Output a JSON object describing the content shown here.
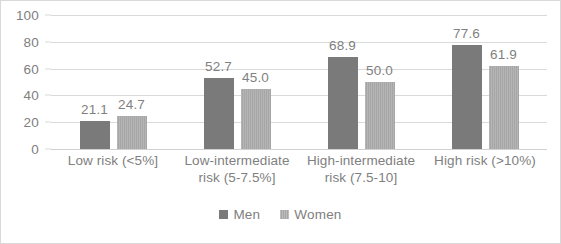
{
  "chart_data": {
    "type": "bar",
    "title": "",
    "subtitle": "",
    "xlabel": "",
    "ylabel": "",
    "ylim": [
      0,
      100
    ],
    "yticks": [
      0,
      20,
      40,
      60,
      80,
      100
    ],
    "ytick_labels": [
      "0",
      "20",
      "40",
      "60",
      "80",
      "100"
    ],
    "grid": true,
    "legend_position": "bottom",
    "categories": [
      "Low risk (<5%]",
      "Low-intermediate risk (5-7.5%]",
      "High-intermediate risk (7.5-10]",
      "High risk (>10%)"
    ],
    "category_lines": [
      [
        "Low risk (<5%]"
      ],
      [
        "Low-intermediate",
        "risk (5-7.5%]"
      ],
      [
        "High-intermediate",
        "risk (7.5-10]"
      ],
      [
        "High risk (>10%)"
      ]
    ],
    "series": [
      {
        "name": "Men",
        "color": "#7a7a7a",
        "values": [
          21.1,
          52.7,
          68.9,
          77.6
        ],
        "labels": [
          "21.1",
          "52.7",
          "68.9",
          "77.6"
        ]
      },
      {
        "name": "Women",
        "color": "#a6a6a6",
        "values": [
          24.7,
          45.0,
          50.0,
          61.9
        ],
        "labels": [
          "24.7",
          "45.0",
          "50.0",
          "61.9"
        ]
      }
    ]
  },
  "legend": {
    "items": [
      {
        "label": "Men"
      },
      {
        "label": "Women"
      }
    ]
  },
  "colors": {
    "men": "#7a7a7a",
    "women": "#a6a6a6",
    "gridline": "#d9d9d9",
    "text": "#808080",
    "border": "#d9d9d9",
    "background": "#ffffff"
  }
}
